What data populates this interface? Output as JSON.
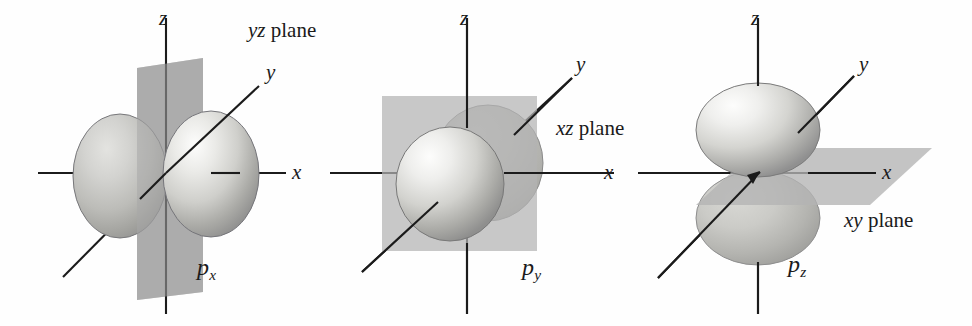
{
  "figure": {
    "background_color": "#ffffff",
    "axis_color": "#1b1b1b",
    "plane_color": "#b0b0b0",
    "plane_color_shaded": "#9a9a9a",
    "lobe_light": "#f2f2f0",
    "lobe_mid": "#c9c9c6",
    "lobe_dark": "#8e8e8b",
    "lobe_outline": "#6f6f6d"
  },
  "panels": [
    {
      "id": "px",
      "orbital_label": "p",
      "orbital_subscript": "x",
      "plane_label_italic": "yz",
      "plane_label_rest": " plane",
      "plane_shape": "vertical-parallelogram",
      "axes": [
        {
          "name": "x",
          "label": "x"
        },
        {
          "name": "y",
          "label": "y"
        },
        {
          "name": "z",
          "label": "z"
        }
      ],
      "lobes": [
        {
          "name": "left-lobe",
          "position": "-x",
          "depth": "behind-plane"
        },
        {
          "name": "right-lobe",
          "position": "+x",
          "depth": "front-of-plane"
        }
      ]
    },
    {
      "id": "py",
      "orbital_label": "p",
      "orbital_subscript": "y",
      "plane_label_italic": "xz",
      "plane_label_rest": " plane",
      "plane_shape": "square",
      "axes": [
        {
          "name": "x",
          "label": "x"
        },
        {
          "name": "y",
          "label": "y"
        },
        {
          "name": "z",
          "label": "z"
        }
      ],
      "lobes": [
        {
          "name": "back-lobe",
          "position": "+y",
          "depth": "behind-plane"
        },
        {
          "name": "front-lobe",
          "position": "-y",
          "depth": "front-of-plane"
        }
      ]
    },
    {
      "id": "pz",
      "orbital_label": "p",
      "orbital_subscript": "z",
      "plane_label_italic": "xy",
      "plane_label_rest": " plane",
      "plane_shape": "horizontal-parallelogram",
      "axes": [
        {
          "name": "x",
          "label": "x"
        },
        {
          "name": "y",
          "label": "y"
        },
        {
          "name": "z",
          "label": "z"
        }
      ],
      "lobes": [
        {
          "name": "top-lobe",
          "position": "+z",
          "depth": "front-of-plane"
        },
        {
          "name": "bottom-lobe",
          "position": "-z",
          "depth": "behind-plane"
        }
      ]
    }
  ]
}
